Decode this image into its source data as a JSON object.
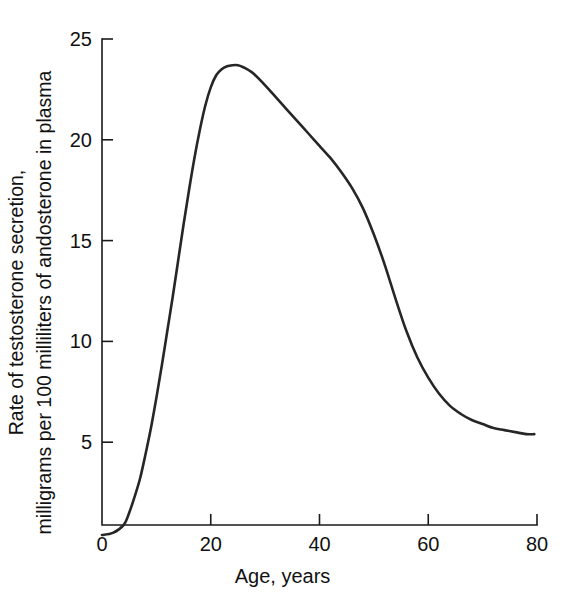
{
  "chart_data": {
    "type": "line",
    "title": "",
    "xlabel": "Age, years",
    "ylabel_line1": "Rate of testosterone secretion,",
    "ylabel_line2": "milligrams per 100 milliliters of andosterone in plasma",
    "ylabel": "Rate of testosterone secretion, milligrams per 100 milliliters of andosterone in plasma",
    "xlim": [
      0,
      80
    ],
    "ylim": [
      0,
      25
    ],
    "xticks": [
      0,
      20,
      40,
      60,
      80
    ],
    "yticks": [
      5,
      10,
      15,
      20,
      25
    ],
    "xtick_labels": [
      "0",
      "20",
      "40",
      "60",
      "80"
    ],
    "ytick_labels": [
      "5",
      "10",
      "15",
      "20",
      "25"
    ],
    "grid": false,
    "legend": false,
    "legend_position": "none",
    "line_color": "#262626",
    "axis_color": "#1a1a1a",
    "background_color": "#ffffff",
    "series": [
      {
        "name": "Rate of testosterone secretion",
        "x": [
          0,
          2,
          4,
          5,
          6,
          7,
          8,
          9,
          10,
          11,
          12,
          13,
          14,
          15,
          16,
          17,
          18,
          19,
          20,
          21,
          22,
          23,
          24,
          25,
          26,
          27,
          28,
          30,
          32,
          34,
          36,
          38,
          40,
          42,
          44,
          46,
          48,
          50,
          52,
          54,
          56,
          58,
          60,
          62,
          64,
          66,
          68,
          70,
          72,
          74,
          76,
          78,
          79.5
        ],
        "values": [
          0.4,
          0.5,
          0.9,
          1.5,
          2.3,
          3.2,
          4.4,
          5.7,
          7.2,
          8.8,
          10.5,
          12.2,
          14.0,
          15.8,
          17.5,
          19.1,
          20.5,
          21.7,
          22.6,
          23.2,
          23.5,
          23.65,
          23.7,
          23.7,
          23.6,
          23.45,
          23.25,
          22.7,
          22.1,
          21.5,
          20.9,
          20.3,
          19.7,
          19.1,
          18.4,
          17.6,
          16.6,
          15.3,
          13.8,
          12.1,
          10.5,
          9.2,
          8.2,
          7.4,
          6.8,
          6.4,
          6.1,
          5.9,
          5.7,
          5.6,
          5.5,
          5.4,
          5.4
        ]
      }
    ],
    "peak": {
      "x": 24.5,
      "y": 23.7
    },
    "start": {
      "x": 0,
      "y": 0.4
    },
    "end": {
      "x": 79.5,
      "y": 5.4
    }
  }
}
